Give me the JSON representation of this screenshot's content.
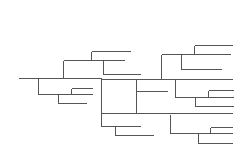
{
  "diagram": {
    "type": "dendrogram",
    "stroke_color": "#555555",
    "background": "#ffffff",
    "segments": [
      [
        18,
        78,
        101,
        78
      ],
      [
        38,
        78,
        38,
        94
      ],
      [
        38,
        94,
        92,
        94
      ],
      [
        58,
        94,
        58,
        103
      ],
      [
        58,
        103,
        86,
        103
      ],
      [
        71,
        88,
        71,
        94
      ],
      [
        71,
        88,
        92,
        88
      ],
      [
        63,
        60,
        63,
        78
      ],
      [
        63,
        60,
        124,
        60
      ],
      [
        91,
        51,
        91,
        60
      ],
      [
        91,
        51,
        130,
        51
      ],
      [
        103,
        60,
        103,
        74
      ],
      [
        103,
        74,
        140,
        74
      ],
      [
        101,
        78,
        101,
        126
      ],
      [
        101,
        79,
        232,
        79
      ],
      [
        136,
        79,
        136,
        113
      ],
      [
        136,
        91,
        167,
        91
      ],
      [
        101,
        113,
        232,
        113
      ],
      [
        161,
        54,
        161,
        79
      ],
      [
        161,
        54,
        230,
        54
      ],
      [
        194,
        45,
        194,
        54
      ],
      [
        194,
        45,
        232,
        45
      ],
      [
        181,
        54,
        181,
        69
      ],
      [
        181,
        69,
        221,
        69
      ],
      [
        175,
        79,
        175,
        97
      ],
      [
        175,
        97,
        233,
        97
      ],
      [
        208,
        90,
        208,
        97
      ],
      [
        208,
        90,
        233,
        90
      ],
      [
        195,
        97,
        195,
        106
      ],
      [
        195,
        106,
        233,
        106
      ],
      [
        170,
        114,
        170,
        133
      ],
      [
        170,
        133,
        232,
        133
      ],
      [
        210,
        127,
        210,
        133
      ],
      [
        210,
        127,
        232,
        127
      ],
      [
        198,
        133,
        198,
        143
      ],
      [
        198,
        143,
        232,
        143
      ],
      [
        101,
        126,
        140,
        126
      ],
      [
        115,
        126,
        115,
        135
      ],
      [
        115,
        135,
        153,
        135
      ]
    ]
  }
}
